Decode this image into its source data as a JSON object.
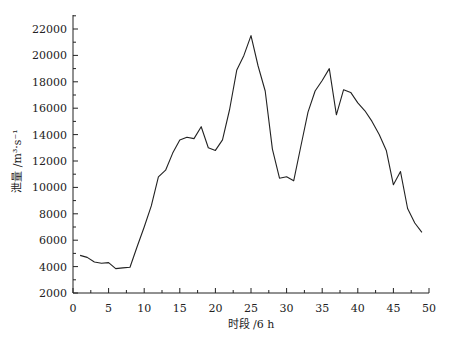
{
  "chart_data": {
    "type": "line",
    "title": "",
    "xlabel": "时段 /6 h",
    "ylabel": "泄量 /m³·s⁻¹",
    "xlim": [
      0,
      50
    ],
    "ylim": [
      2000,
      23000
    ],
    "xticks": [
      0,
      5,
      10,
      15,
      20,
      25,
      30,
      35,
      40,
      45,
      50
    ],
    "yticks": [
      2000,
      4000,
      6000,
      8000,
      10000,
      12000,
      14000,
      16000,
      18000,
      20000,
      22000
    ],
    "grid": false,
    "legend": null,
    "series": [
      {
        "name": "泄量",
        "x": [
          1,
          2,
          3,
          4,
          5,
          6,
          7,
          8,
          9,
          10,
          11,
          12,
          13,
          14,
          15,
          16,
          17,
          18,
          19,
          20,
          21,
          22,
          23,
          24,
          25,
          26,
          27,
          28,
          29,
          30,
          31,
          32,
          33,
          34,
          35,
          36,
          37,
          38,
          39,
          40,
          41,
          42,
          43,
          44,
          45,
          46,
          47,
          48,
          49
        ],
        "values": [
          4850,
          4700,
          4350,
          4250,
          4300,
          3850,
          3900,
          3950,
          5500,
          7000,
          8600,
          10800,
          11300,
          12600,
          13600,
          13800,
          13700,
          14600,
          13000,
          12800,
          13600,
          15900,
          18900,
          20000,
          21500,
          19200,
          17300,
          12900,
          10700,
          10800,
          10500,
          13100,
          15700,
          17300,
          18100,
          19000,
          15500,
          17400,
          17200,
          16400,
          15800,
          15000,
          14000,
          12800,
          10200,
          11200,
          8400,
          7300,
          6600
        ]
      }
    ]
  }
}
